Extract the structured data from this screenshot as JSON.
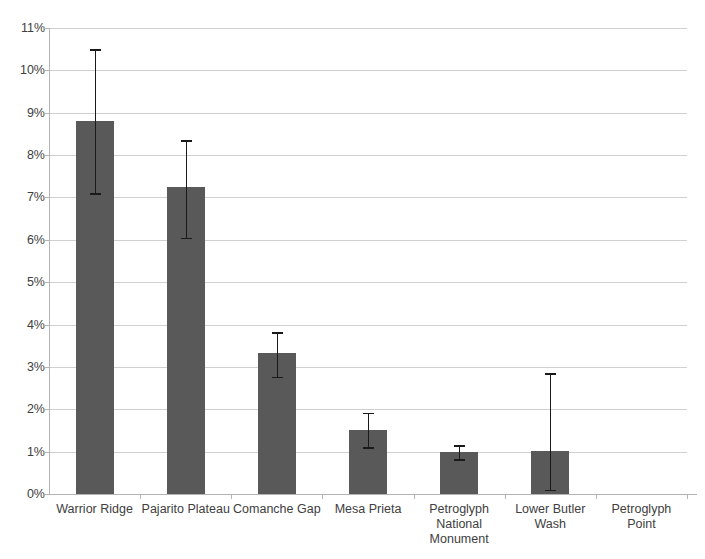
{
  "chart_data": {
    "type": "bar",
    "title": "",
    "xlabel": "",
    "ylabel": "",
    "grid": true,
    "legend": "none",
    "ylim": [
      0,
      11
    ],
    "yticks": [
      "0%",
      "1%",
      "2%",
      "3%",
      "4%",
      "5%",
      "6%",
      "7%",
      "8%",
      "9%",
      "10%",
      "11%"
    ],
    "ytick_values": [
      0,
      1,
      2,
      3,
      4,
      5,
      6,
      7,
      8,
      9,
      10,
      11
    ],
    "units": "percent",
    "categories": [
      "Warrior Ridge",
      "Pajarito Plateau",
      "Comanche Gap",
      "Mesa Prieta",
      "Petroglyph National Monument",
      "Lower Butler Wash",
      "Petroglyph Point"
    ],
    "values": [
      8.8,
      7.25,
      3.32,
      1.52,
      0.98,
      1.02,
      0
    ],
    "error_low": [
      7.1,
      6.05,
      2.77,
      1.1,
      0.82,
      0.1,
      0
    ],
    "error_high": [
      10.5,
      8.35,
      3.82,
      1.92,
      1.15,
      2.85,
      0
    ],
    "series": [
      {
        "name": "percent",
        "values": [
          8.8,
          7.25,
          3.32,
          1.52,
          0.98,
          1.02,
          0
        ]
      }
    ],
    "colors": {
      "bar": "#595959",
      "error_bar": "#1a1a1a",
      "grid": "#d0d0d0",
      "axis": "#b4b4b4",
      "text": "#404040",
      "background": "#ffffff"
    }
  },
  "axis": {
    "y_labels": [
      "11%",
      "10%",
      "9%",
      "8%",
      "7%",
      "6%",
      "5%",
      "4%",
      "3%",
      "2%",
      "1%",
      "0%"
    ],
    "x_labels": [
      "Warrior Ridge",
      "Pajarito Plateau",
      "Comanche Gap",
      "Mesa Prieta",
      "Petroglyph\nNational\nMonument",
      "Lower Butler Wash",
      "Petroglyph Point"
    ]
  }
}
